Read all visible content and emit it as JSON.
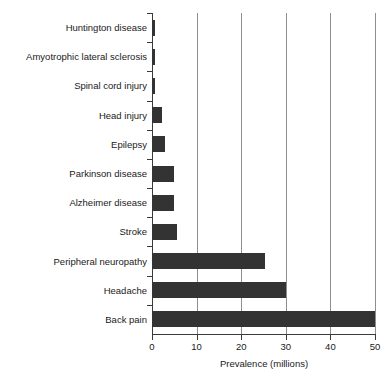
{
  "chart_data": {
    "type": "bar",
    "orientation": "horizontal",
    "title": "",
    "xlabel": "Prevalence (millions)",
    "ylabel": "",
    "xlim": [
      0,
      50
    ],
    "xticks": [
      0,
      10,
      20,
      30,
      40,
      50
    ],
    "xtick_labels": [
      "0",
      "10",
      "20",
      "30",
      "40",
      "50"
    ],
    "grid": "vertical",
    "legend": "none",
    "bar_color": "#333333",
    "categories": [
      "Huntington disease",
      "Amyotrophic lateral sclerosis",
      "Spinal cord injury",
      "Head injury",
      "Epilepsy",
      "Parkinson disease",
      "Alzheimer disease",
      "Stroke",
      "Peripheral neuropathy",
      "Headache",
      "Back pain"
    ],
    "values": [
      0.6,
      0.6,
      0.6,
      2.2,
      3.0,
      5.0,
      5.0,
      5.5,
      25.3,
      30.0,
      50.0
    ]
  }
}
